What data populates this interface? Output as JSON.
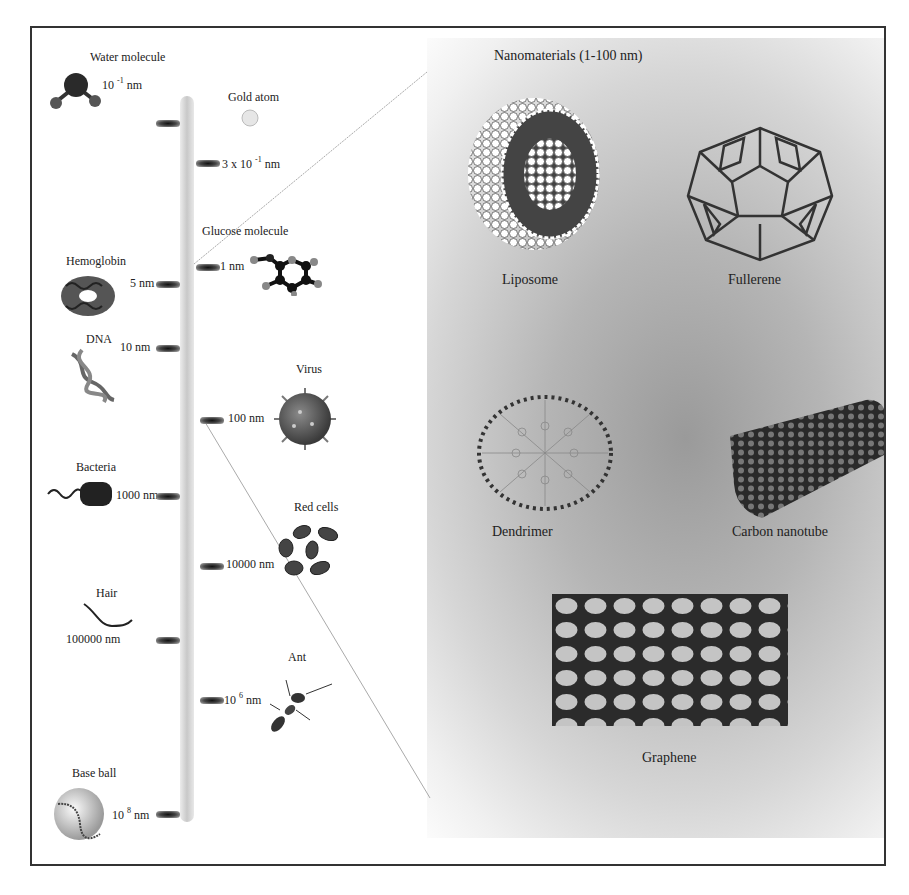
{
  "figure": {
    "title": "Nanomaterials (1-100 nm)",
    "scale_items_left": [
      {
        "name": "Water molecule",
        "size": "10 -1 nm"
      },
      {
        "name": "Hemoglobin",
        "size": "5 nm"
      },
      {
        "name": "DNA",
        "size": "10 nm"
      },
      {
        "name": "Bacteria",
        "size": "1000 nm"
      },
      {
        "name": "Hair",
        "size": "100000 nm"
      },
      {
        "name": "Base ball",
        "size": "10 8 nm"
      }
    ],
    "scale_items_right": [
      {
        "name": "Gold atom",
        "size": "3 x 10 -1 nm"
      },
      {
        "name": "Glucose molecule",
        "size": "1 nm"
      },
      {
        "name": "Virus",
        "size": "100 nm"
      },
      {
        "name": "Red cells",
        "size": "10000 nm"
      },
      {
        "name": "Ant",
        "size": "10 6 nm"
      }
    ],
    "nanomaterials": [
      {
        "name": "Liposome"
      },
      {
        "name": "Fullerene"
      },
      {
        "name": "Dendrimer"
      },
      {
        "name": "Carbon nanotube"
      },
      {
        "name": "Graphene"
      }
    ],
    "colors": {
      "border": "#333333",
      "panel_dark": "#9a9a9a",
      "panel_light": "#f0f0f0",
      "text": "#222222"
    }
  }
}
